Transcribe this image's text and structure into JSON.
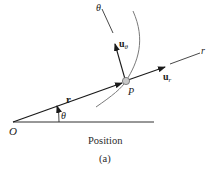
{
  "diagram": {
    "labels": {
      "origin": "O",
      "point": "P",
      "theta_angle": "θ",
      "theta_axis": "θ",
      "r_axis": "r",
      "position_vector": "r",
      "u_theta_base": "u",
      "u_theta_sub": "θ",
      "u_r_base": "u",
      "u_r_sub": "r"
    },
    "caption": "Position",
    "sub_caption": "(a)",
    "colors": {
      "line": "#1a1a1a",
      "curve": "#7a7a7a",
      "particle": "#b0b0b0"
    }
  }
}
